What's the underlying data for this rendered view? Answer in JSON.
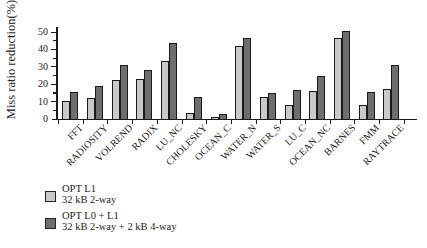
{
  "figure": {
    "background": "#ffffff",
    "axis_color": "#1a1a1a"
  },
  "chart_data": {
    "type": "bar",
    "title": "",
    "xlabel": "",
    "ylabel": "Miss ratio reduction(%)",
    "ylim": [
      0,
      52
    ],
    "yticks": [
      0,
      10,
      20,
      30,
      40,
      50
    ],
    "ytick_minor_interval": 5,
    "grid": false,
    "legend_position": "bottom-left",
    "categories": [
      "FFT",
      "RADIOSITY",
      "VOLREND",
      "RADIX",
      "LU_NC",
      "CHOLESKY",
      "OCEAN_C",
      "WATER_N",
      "WATER_S",
      "LU_C",
      "OCEAN_NC",
      "BARNES",
      "FMM",
      "RAYTRACE"
    ],
    "series": [
      {
        "name": "OPT L1",
        "subtitle": "32 kB 2-way",
        "color": "#c9c9c9",
        "values": [
          10,
          12,
          22,
          22.5,
          33,
          3,
          1,
          41.5,
          12.5,
          7.5,
          16,
          46.5,
          7.5,
          17
        ]
      },
      {
        "name": "OPT L0 + L1",
        "subtitle": "32 kB 2-way + 2 kB 4-way",
        "color": "#6e6e6e",
        "values": [
          15,
          18.5,
          30.5,
          28,
          43.5,
          12.5,
          2.5,
          46.5,
          14.5,
          16.5,
          24.5,
          50.5,
          15.5,
          31
        ]
      }
    ]
  }
}
